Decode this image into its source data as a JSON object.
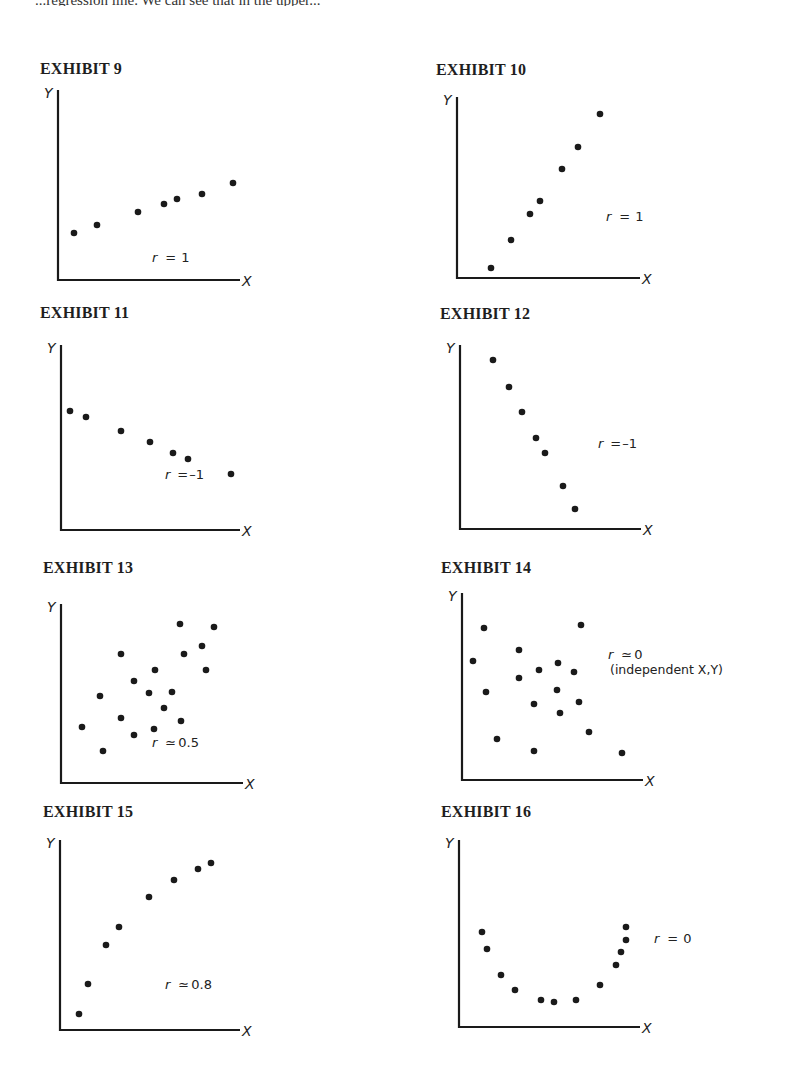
{
  "page": {
    "cut_off_text": "...regression line. We can see that in the upper..."
  },
  "chart_data": [
    {
      "type": "scatter",
      "title": "EXHIBIT 9",
      "xlabel": "X",
      "ylabel": "Y",
      "annotation": "r = 1",
      "grid": false,
      "points": [
        [
          74,
          233
        ],
        [
          97,
          225
        ],
        [
          138,
          212
        ],
        [
          164,
          204
        ],
        [
          177,
          199
        ],
        [
          202,
          194
        ],
        [
          233,
          183
        ]
      ],
      "box": {
        "x0": 58,
        "y0": 90,
        "x1": 240,
        "y1": 280
      }
    },
    {
      "type": "scatter",
      "title": "EXHIBIT 10",
      "xlabel": "X",
      "ylabel": "Y",
      "annotation": "r = 1",
      "grid": false,
      "points": [
        [
          491,
          268
        ],
        [
          511,
          240
        ],
        [
          530,
          214
        ],
        [
          540,
          201
        ],
        [
          562,
          169
        ],
        [
          578,
          147
        ],
        [
          600,
          114
        ]
      ],
      "box": {
        "x0": 457,
        "y0": 97,
        "x1": 640,
        "y1": 278
      }
    },
    {
      "type": "scatter",
      "title": "EXHIBIT 11",
      "xlabel": "X",
      "ylabel": "Y",
      "annotation": "r = −1",
      "grid": false,
      "points": [
        [
          70,
          411
        ],
        [
          86,
          417
        ],
        [
          121,
          431
        ],
        [
          150,
          442
        ],
        [
          173,
          453
        ],
        [
          188,
          459
        ],
        [
          231,
          474
        ]
      ],
      "box": {
        "x0": 61,
        "y0": 345,
        "x1": 240,
        "y1": 530
      }
    },
    {
      "type": "scatter",
      "title": "EXHIBIT 12",
      "xlabel": "X",
      "ylabel": "Y",
      "annotation": "r = −1",
      "grid": false,
      "points": [
        [
          493,
          360
        ],
        [
          509,
          387
        ],
        [
          522,
          412
        ],
        [
          536,
          438
        ],
        [
          545,
          453
        ],
        [
          563,
          486
        ],
        [
          575,
          509
        ]
      ],
      "box": {
        "x0": 460,
        "y0": 345,
        "x1": 641,
        "y1": 529
      }
    },
    {
      "type": "scatter",
      "title": "EXHIBIT 13",
      "xlabel": "X",
      "ylabel": "Y",
      "annotation": "r ≃ 0.5",
      "grid": false,
      "points": [
        [
          82,
          727
        ],
        [
          103,
          751
        ],
        [
          100,
          696
        ],
        [
          121,
          654
        ],
        [
          121,
          718
        ],
        [
          134,
          735
        ],
        [
          134,
          681
        ],
        [
          149,
          693
        ],
        [
          154,
          729
        ],
        [
          155,
          670
        ],
        [
          164,
          708
        ],
        [
          172,
          692
        ],
        [
          181,
          721
        ],
        [
          180,
          624
        ],
        [
          184,
          654
        ],
        [
          202,
          646
        ],
        [
          206,
          670
        ],
        [
          214,
          627
        ]
      ],
      "box": {
        "x0": 61,
        "y0": 604,
        "x1": 243,
        "y1": 783
      }
    },
    {
      "type": "scatter",
      "title": "EXHIBIT 14",
      "xlabel": "X",
      "ylabel": "Y",
      "annotation": "r ≃ 0",
      "annotation_sub": "(independent X,Y)",
      "grid": false,
      "points": [
        [
          473,
          661
        ],
        [
          484,
          628
        ],
        [
          486,
          692
        ],
        [
          497,
          739
        ],
        [
          519,
          650
        ],
        [
          519,
          678
        ],
        [
          534,
          704
        ],
        [
          539,
          670
        ],
        [
          534,
          751
        ],
        [
          558,
          663
        ],
        [
          557,
          690
        ],
        [
          560,
          713
        ],
        [
          574,
          672
        ],
        [
          581,
          625
        ],
        [
          579,
          702
        ],
        [
          589,
          732
        ],
        [
          622,
          753
        ]
      ],
      "box": {
        "x0": 462,
        "y0": 593,
        "x1": 643,
        "y1": 780
      }
    },
    {
      "type": "scatter",
      "title": "EXHIBIT 15",
      "xlabel": "X",
      "ylabel": "Y",
      "annotation": "r ≃ 0.8",
      "grid": false,
      "points": [
        [
          79,
          1014
        ],
        [
          88,
          984
        ],
        [
          106,
          945
        ],
        [
          119,
          927
        ],
        [
          149,
          897
        ],
        [
          174,
          880
        ],
        [
          198,
          869
        ],
        [
          211,
          863
        ]
      ],
      "box": {
        "x0": 60,
        "y0": 840,
        "x1": 240,
        "y1": 1030
      }
    },
    {
      "type": "scatter",
      "title": "EXHIBIT 16",
      "xlabel": "X",
      "ylabel": "Y",
      "annotation": "r = 0",
      "grid": false,
      "points": [
        [
          482,
          932
        ],
        [
          487,
          949
        ],
        [
          501,
          975
        ],
        [
          515,
          990
        ],
        [
          541,
          1000
        ],
        [
          554,
          1002
        ],
        [
          576,
          1000
        ],
        [
          600,
          985
        ],
        [
          616,
          965
        ],
        [
          621,
          952
        ],
        [
          626,
          940
        ],
        [
          626,
          927
        ]
      ],
      "box": {
        "x0": 459,
        "y0": 840,
        "x1": 640,
        "y1": 1027
      }
    }
  ],
  "exhibits": {
    "e9": {
      "title": "EXHIBIT 9",
      "r_var": "r",
      "r_rel": "=",
      "r_val": "1",
      "sub": ""
    },
    "e10": {
      "title": "EXHIBIT 10",
      "r_var": "r",
      "r_rel": "=",
      "r_val": "1",
      "sub": ""
    },
    "e11": {
      "title": "EXHIBIT 11",
      "r_var": "r",
      "r_rel": "=",
      "r_val": "–1",
      "sub": ""
    },
    "e12": {
      "title": "EXHIBIT 12",
      "r_var": "r",
      "r_rel": "=",
      "r_val": "–1",
      "sub": ""
    },
    "e13": {
      "title": "EXHIBIT 13",
      "r_var": "r",
      "r_rel": "≃",
      "r_val": "0.5",
      "sub": ""
    },
    "e14": {
      "title": "EXHIBIT 14",
      "r_var": "r",
      "r_rel": "≃",
      "r_val": "0",
      "sub": "(independent X,Y)"
    },
    "e15": {
      "title": "EXHIBIT 15",
      "r_var": "r",
      "r_rel": "≃",
      "r_val": "0.8",
      "sub": ""
    },
    "e16": {
      "title": "EXHIBIT 16",
      "r_var": "r",
      "r_rel": "=",
      "r_val": "0",
      "sub": ""
    }
  },
  "axes": {
    "x_label": "X",
    "y_label": "Y"
  }
}
